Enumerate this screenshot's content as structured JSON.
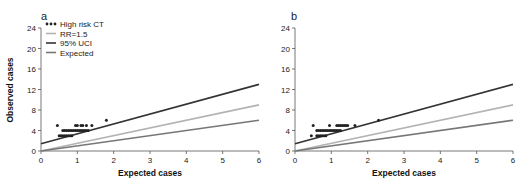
{
  "chart_data": [
    {
      "type": "scatter",
      "panel_label": "a",
      "xlabel": "Expected cases",
      "ylabel": "Observed cases",
      "xlim": [
        0,
        6
      ],
      "ylim": [
        0,
        24
      ],
      "xticks": [
        0,
        1,
        2,
        3,
        4,
        5,
        6
      ],
      "yticks": [
        0,
        4,
        8,
        12,
        16,
        20,
        24
      ],
      "grid": false,
      "legend": {
        "position": "upper-left",
        "entries": [
          "High risk CT",
          "RR=1.5",
          "95% UCI",
          "Expected"
        ]
      },
      "series": [
        {
          "name": "High risk CT",
          "kind": "points",
          "color": "#222222",
          "points": [
            [
              0.45,
              5
            ],
            [
              0.95,
              5
            ],
            [
              1.0,
              5
            ],
            [
              1.1,
              5
            ],
            [
              1.15,
              5
            ],
            [
              1.25,
              5
            ],
            [
              1.4,
              5
            ],
            [
              1.8,
              6
            ],
            [
              0.6,
              4
            ],
            [
              0.65,
              4
            ],
            [
              0.7,
              4
            ],
            [
              0.75,
              4
            ],
            [
              0.8,
              4
            ],
            [
              0.85,
              4
            ],
            [
              0.9,
              4
            ],
            [
              0.95,
              4
            ],
            [
              1.0,
              4
            ],
            [
              1.05,
              4
            ],
            [
              1.1,
              4
            ],
            [
              1.15,
              4
            ],
            [
              1.2,
              4
            ],
            [
              1.25,
              4
            ],
            [
              1.3,
              4
            ],
            [
              0.5,
              3
            ],
            [
              0.55,
              3
            ],
            [
              0.6,
              3
            ],
            [
              0.65,
              3
            ],
            [
              0.7,
              3
            ],
            [
              0.75,
              3
            ],
            [
              0.8,
              3
            ],
            [
              0.85,
              3
            ]
          ]
        },
        {
          "name": "RR=1.5",
          "kind": "line",
          "color": "#b3b3b3",
          "x": [
            0,
            6
          ],
          "y": [
            0,
            9
          ]
        },
        {
          "name": "95% UCI",
          "kind": "line",
          "color": "#333333",
          "x": [
            0,
            6
          ],
          "y": [
            1.4,
            13
          ]
        },
        {
          "name": "Expected",
          "kind": "line",
          "color": "#777777",
          "x": [
            0,
            6
          ],
          "y": [
            0,
            6
          ]
        }
      ]
    },
    {
      "type": "scatter",
      "panel_label": "b",
      "xlabel": "Expected cases",
      "ylabel": "",
      "xlim": [
        0,
        6
      ],
      "ylim": [
        0,
        24
      ],
      "xticks": [
        0,
        1,
        2,
        3,
        4,
        5,
        6
      ],
      "yticks": [
        0,
        4,
        8,
        12,
        16,
        20,
        24
      ],
      "grid": false,
      "series": [
        {
          "name": "High risk CT",
          "kind": "points",
          "color": "#222222",
          "points": [
            [
              0.5,
              5
            ],
            [
              0.95,
              5
            ],
            [
              1.15,
              5
            ],
            [
              1.2,
              5
            ],
            [
              1.25,
              5
            ],
            [
              1.3,
              5
            ],
            [
              1.35,
              5
            ],
            [
              1.4,
              5
            ],
            [
              1.45,
              5
            ],
            [
              1.65,
              5
            ],
            [
              2.3,
              6
            ],
            [
              0.6,
              4
            ],
            [
              0.65,
              4
            ],
            [
              0.7,
              4
            ],
            [
              0.75,
              4
            ],
            [
              0.8,
              4
            ],
            [
              0.85,
              4
            ],
            [
              0.9,
              4
            ],
            [
              0.95,
              4
            ],
            [
              1.0,
              4
            ],
            [
              1.05,
              4
            ],
            [
              1.1,
              4
            ],
            [
              1.15,
              4
            ],
            [
              1.2,
              4
            ],
            [
              1.25,
              4
            ],
            [
              0.45,
              3
            ],
            [
              0.6,
              3
            ],
            [
              0.65,
              3
            ],
            [
              0.7,
              3
            ],
            [
              0.75,
              3
            ],
            [
              0.8,
              3
            ],
            [
              0.85,
              3
            ]
          ]
        },
        {
          "name": "RR=1.5",
          "kind": "line",
          "color": "#b3b3b3",
          "x": [
            0,
            6
          ],
          "y": [
            0,
            9
          ]
        },
        {
          "name": "95% UCI",
          "kind": "line",
          "color": "#333333",
          "x": [
            0,
            6
          ],
          "y": [
            1.4,
            13
          ]
        },
        {
          "name": "Expected",
          "kind": "line",
          "color": "#777777",
          "x": [
            0,
            6
          ],
          "y": [
            0,
            6
          ]
        }
      ]
    }
  ]
}
